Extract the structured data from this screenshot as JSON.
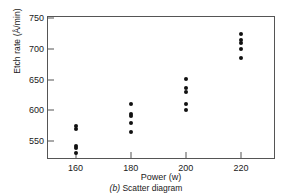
{
  "chart_data": {
    "type": "scatter",
    "title": "",
    "caption_label": "(b)",
    "caption_text": "Scatter diagram",
    "xlabel": "Power (w)",
    "ylabel": "Etch rate (Å/min)",
    "xticks": [
      160,
      180,
      200,
      220
    ],
    "yticks": [
      550,
      600,
      650,
      700,
      750
    ],
    "xlim": [
      150,
      232
    ],
    "ylim": [
      522,
      752
    ],
    "grid": false,
    "legend": null,
    "marker": "filled-circle",
    "marker_color": "#111111",
    "axis_color": "#555555",
    "background": "#ffffff",
    "x": [
      160,
      160,
      160,
      160,
      160,
      180,
      180,
      180,
      180,
      180,
      200,
      200,
      200,
      200,
      200,
      220,
      220,
      220,
      220,
      220
    ],
    "y": [
      575,
      542,
      530,
      539,
      570,
      565,
      593,
      590,
      579,
      610,
      600,
      651,
      610,
      637,
      629,
      725,
      700,
      715,
      685,
      710
    ],
    "groups": [
      {
        "power": 160,
        "values": [
          575,
          570,
          542,
          539,
          530
        ]
      },
      {
        "power": 180,
        "values": [
          610,
          593,
          590,
          579,
          565
        ]
      },
      {
        "power": 200,
        "values": [
          651,
          637,
          629,
          610,
          600
        ]
      },
      {
        "power": 220,
        "values": [
          725,
          715,
          710,
          700,
          685
        ]
      }
    ]
  }
}
